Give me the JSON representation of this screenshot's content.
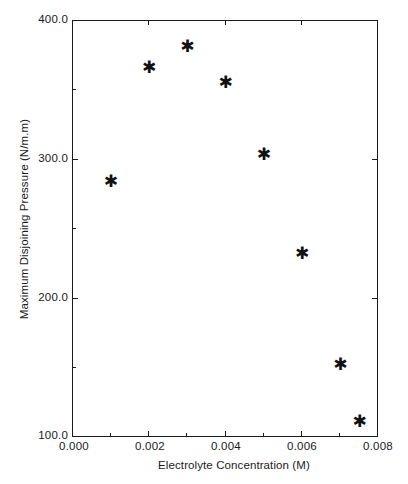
{
  "chart_data": {
    "type": "scatter",
    "title": "",
    "xlabel": "Electrolyte Concentration (M)",
    "ylabel": "Maximum Disjoining Pressure (N/m.m)",
    "xlim": [
      0.0,
      0.008
    ],
    "ylim": [
      100.0,
      400.0
    ],
    "grid": false,
    "legend": null,
    "marker": "asterisk",
    "marker_color": "#111111",
    "x_ticks": [
      "0.000",
      "0.002",
      "0.004",
      "0.006",
      "0.008"
    ],
    "x_tick_values": [
      0.0,
      0.002,
      0.004,
      0.006,
      0.008
    ],
    "y_ticks": [
      "400.0",
      "300.0",
      "200.0",
      "100.0"
    ],
    "y_tick_values": [
      400.0,
      300.0,
      200.0,
      100.0
    ],
    "x": [
      0.001,
      0.002,
      0.003,
      0.004,
      0.005,
      0.006,
      0.007,
      0.0075
    ],
    "y": [
      284,
      366,
      381,
      355,
      303,
      232,
      152,
      111
    ],
    "points": [
      {
        "x": 0.001,
        "y": 284
      },
      {
        "x": 0.002,
        "y": 366
      },
      {
        "x": 0.003,
        "y": 381
      },
      {
        "x": 0.004,
        "y": 355
      },
      {
        "x": 0.005,
        "y": 303
      },
      {
        "x": 0.006,
        "y": 232
      },
      {
        "x": 0.007,
        "y": 152
      },
      {
        "x": 0.0075,
        "y": 111
      }
    ],
    "marker_glyph": "✱",
    "axis_color": "#1a1a1a"
  }
}
